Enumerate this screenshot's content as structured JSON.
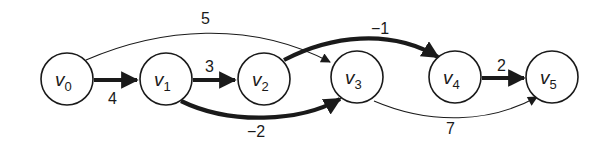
{
  "graph": {
    "title": "",
    "colors": {
      "stroke": "#1a1a1a",
      "background": "#ffffff"
    },
    "nodes": [
      {
        "id": "v0",
        "name": "v",
        "sub": "0"
      },
      {
        "id": "v1",
        "name": "v",
        "sub": "1"
      },
      {
        "id": "v2",
        "name": "v",
        "sub": "2"
      },
      {
        "id": "v3",
        "name": "v",
        "sub": "3"
      },
      {
        "id": "v4",
        "name": "v",
        "sub": "4"
      },
      {
        "id": "v5",
        "name": "v",
        "sub": "5"
      }
    ],
    "edges": [
      {
        "from": "v0",
        "to": "v1",
        "weight": "4",
        "bold": true
      },
      {
        "from": "v1",
        "to": "v2",
        "weight": "3",
        "bold": true
      },
      {
        "from": "v0",
        "to": "v3",
        "weight": "5",
        "bold": false
      },
      {
        "from": "v1",
        "to": "v3",
        "weight": "−2",
        "bold": true
      },
      {
        "from": "v2",
        "to": "v4",
        "weight": "−1",
        "bold": true
      },
      {
        "from": "v2",
        "to": "v3",
        "weight": "",
        "bold": false
      },
      {
        "from": "v4",
        "to": "v5",
        "weight": "2",
        "bold": true
      },
      {
        "from": "v3",
        "to": "v5",
        "weight": "7",
        "bold": false
      }
    ]
  }
}
